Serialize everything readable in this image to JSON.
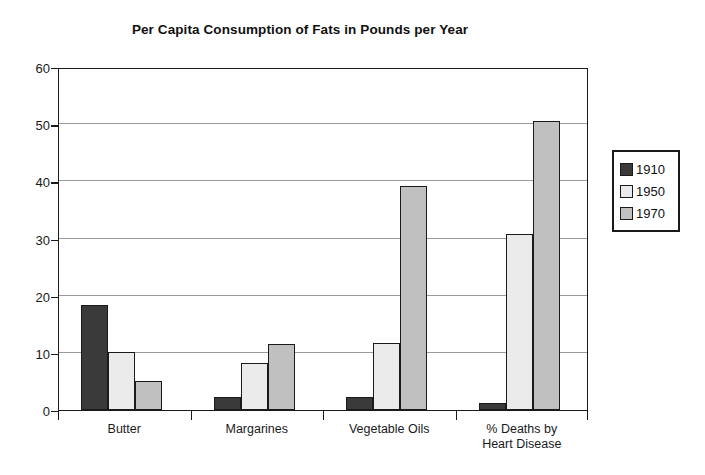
{
  "chart_data": {
    "type": "bar",
    "title": "Per Capita Consumption of Fats in Pounds per Year",
    "xlabel": "",
    "ylabel": "",
    "ylim": [
      0,
      60
    ],
    "yticks": [
      0,
      10,
      20,
      30,
      40,
      50,
      60
    ],
    "grid": true,
    "legend_position": "right",
    "categories": [
      "Butter",
      "Margarines",
      "Vegetable Oils",
      "% Deaths by\nHeart Disease"
    ],
    "category_labels": [
      {
        "line1": "Butter",
        "line2": ""
      },
      {
        "line1": "Margarines",
        "line2": ""
      },
      {
        "line1": "Vegetable Oils",
        "line2": ""
      },
      {
        "line1": "% Deaths by",
        "line2": "Heart Disease"
      }
    ],
    "series": [
      {
        "name": "1910",
        "color": "#3a3a3a",
        "values": [
          18.4,
          2.3,
          2.3,
          1.3
        ]
      },
      {
        "name": "1950",
        "color": "#ebebeb",
        "values": [
          10.1,
          8.3,
          11.7,
          30.8
        ]
      },
      {
        "name": "1970",
        "color": "#c0c0c0",
        "values": [
          5.1,
          11.6,
          39.2,
          50.5
        ]
      }
    ]
  },
  "legend": {
    "items": [
      {
        "label": "1910",
        "color": "#3a3a3a"
      },
      {
        "label": "1950",
        "color": "#ebebeb"
      },
      {
        "label": "1970",
        "color": "#c0c0c0"
      }
    ]
  },
  "axis": {
    "y_tick_labels": [
      "0",
      "10",
      "20",
      "30",
      "40",
      "50",
      "60"
    ]
  },
  "colors": {
    "axis": "#1a1a1a",
    "gridline": "#9a9a9a",
    "background": "#ffffff"
  }
}
